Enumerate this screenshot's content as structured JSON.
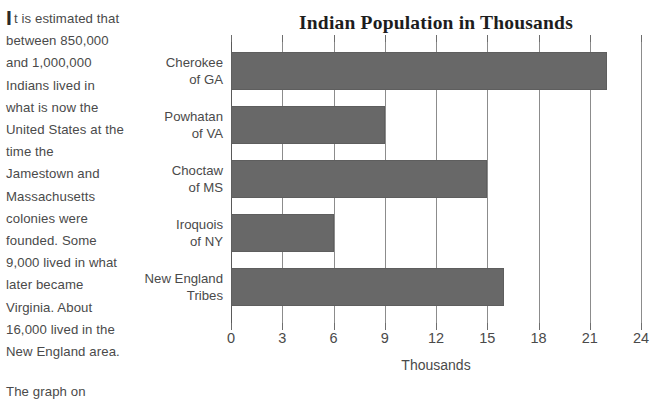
{
  "article": {
    "dropcap": "I",
    "paragraph_1": "t is estimated that between 850,000 and 1,000,000 Indians lived in what is now the United States at the time the Jamestown and Massachusetts colonies were founded. Some 9,000 lived in what later became Virginia. About 16,000 lived in the New England area.",
    "paragraph_2": "The graph on"
  },
  "chart_data": {
    "type": "bar",
    "orientation": "horizontal",
    "title": "Indian Population in Thousands",
    "xlabel": "Thousands",
    "ylabel": "",
    "categories": [
      "Cherokee\nof GA",
      "Powhatan\nof VA",
      "Choctaw\nof MS",
      "Iroquois\nof NY",
      "New England\nTribes"
    ],
    "values": [
      22,
      9,
      15,
      6,
      16
    ],
    "xlim": [
      0,
      24
    ],
    "xticks": [
      0,
      3,
      6,
      9,
      12,
      15,
      18,
      21,
      24
    ],
    "xtick_labels": [
      "0",
      "3",
      "6",
      "9",
      "12",
      "15",
      "18",
      "21",
      "24"
    ],
    "grid": "vertical",
    "legend": "none",
    "bar_color": "#686868",
    "gridline_color": "#8c8c8c",
    "axis_color": "#5a5a5a"
  }
}
